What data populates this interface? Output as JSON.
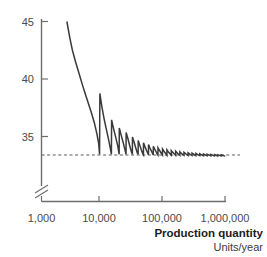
{
  "chart_data": {
    "type": "line",
    "title": "",
    "xlabel": "Production quantity",
    "xlabel_sub": "Units/year",
    "ylabel": "",
    "x_scale": "log",
    "x_tick_labels": [
      "1,000",
      "10,000",
      "100,000",
      "1,000,000"
    ],
    "x_tick_values": [
      1000,
      10000,
      100000,
      1000000
    ],
    "xlim": [
      1000,
      1000000
    ],
    "y_tick_labels": [
      "45",
      "40",
      "35"
    ],
    "y_tick_values": [
      45,
      40,
      35
    ],
    "ylim": [
      33.0,
      45.5
    ],
    "y_axis_break": true,
    "x_axis_break": true,
    "grid": false,
    "legend": "none",
    "asymptote_value": 33.4,
    "asymptote_style": "dashed",
    "series": [
      {
        "name": "unit cost",
        "color": "#3a3a3a",
        "description": "Decaying sawtooth: cost falls with quantity then jumps up at each capacity step, converging on the asymptote.",
        "points": [
          [
            2600,
            45.0
          ],
          [
            2900,
            43.6
          ],
          [
            3200,
            42.5
          ],
          [
            3600,
            41.5
          ],
          [
            4100,
            40.5
          ],
          [
            4600,
            39.6
          ],
          [
            5200,
            38.7
          ],
          [
            5900,
            37.8
          ],
          [
            6600,
            37.0
          ],
          [
            7300,
            36.2
          ],
          [
            8000,
            35.3
          ],
          [
            8600,
            34.4
          ],
          [
            8900,
            33.45
          ],
          [
            9000,
            38.75
          ],
          [
            9700,
            37.6
          ],
          [
            10500,
            36.6
          ],
          [
            11400,
            35.7
          ],
          [
            12300,
            34.9
          ],
          [
            13200,
            34.1
          ],
          [
            13900,
            33.45
          ],
          [
            14000,
            36.45
          ],
          [
            15200,
            35.6
          ],
          [
            16400,
            34.9
          ],
          [
            17600,
            34.2
          ],
          [
            18600,
            33.45
          ],
          [
            18700,
            35.75
          ],
          [
            20100,
            35.1
          ],
          [
            21600,
            34.5
          ],
          [
            23000,
            33.9
          ],
          [
            24100,
            33.45
          ],
          [
            24200,
            35.35
          ],
          [
            25900,
            34.8
          ],
          [
            27700,
            34.2
          ],
          [
            29400,
            33.7
          ],
          [
            30600,
            33.45
          ],
          [
            30700,
            34.95
          ],
          [
            32700,
            34.5
          ],
          [
            34800,
            34.0
          ],
          [
            36700,
            33.6
          ],
          [
            38000,
            33.45
          ],
          [
            38100,
            34.65
          ],
          [
            40400,
            34.25
          ],
          [
            42800,
            33.85
          ],
          [
            45000,
            33.55
          ],
          [
            46400,
            33.42
          ],
          [
            46500,
            34.45
          ],
          [
            49200,
            34.1
          ],
          [
            52000,
            33.8
          ],
          [
            54500,
            33.55
          ],
          [
            56100,
            33.42
          ],
          [
            56200,
            34.3
          ],
          [
            59300,
            34.0
          ],
          [
            62500,
            33.75
          ],
          [
            65400,
            33.52
          ],
          [
            67200,
            33.4
          ],
          [
            67300,
            34.15
          ],
          [
            70900,
            33.9
          ],
          [
            74600,
            33.68
          ],
          [
            78000,
            33.5
          ],
          [
            80100,
            33.4
          ],
          [
            80200,
            34.02
          ],
          [
            84400,
            33.82
          ],
          [
            88700,
            33.63
          ],
          [
            92600,
            33.48
          ],
          [
            95000,
            33.4
          ],
          [
            95100,
            33.92
          ],
          [
            100000,
            33.74
          ],
          [
            105000,
            33.58
          ],
          [
            109500,
            33.46
          ],
          [
            112300,
            33.38
          ],
          [
            112400,
            33.84
          ],
          [
            118000,
            33.68
          ],
          [
            124000,
            33.54
          ],
          [
            129000,
            33.44
          ],
          [
            132300,
            33.38
          ],
          [
            132400,
            33.78
          ],
          [
            139000,
            33.64
          ],
          [
            146000,
            33.52
          ],
          [
            152000,
            33.43
          ],
          [
            155800,
            33.37
          ],
          [
            155900,
            33.72
          ],
          [
            163500,
            33.6
          ],
          [
            171500,
            33.49
          ],
          [
            178500,
            33.41
          ],
          [
            182800,
            33.36
          ],
          [
            182900,
            33.67
          ],
          [
            191500,
            33.56
          ],
          [
            200600,
            33.47
          ],
          [
            208500,
            33.4
          ],
          [
            213400,
            33.36
          ],
          [
            213500,
            33.63
          ],
          [
            223500,
            33.54
          ],
          [
            234000,
            33.45
          ],
          [
            243000,
            33.39
          ],
          [
            248600,
            33.35
          ],
          [
            248700,
            33.59
          ],
          [
            260000,
            33.51
          ],
          [
            272000,
            33.43
          ],
          [
            282500,
            33.38
          ],
          [
            288800,
            33.35
          ],
          [
            288900,
            33.56
          ],
          [
            302000,
            33.49
          ],
          [
            315500,
            33.42
          ],
          [
            327500,
            33.37
          ],
          [
            334700,
            33.34
          ],
          [
            334800,
            33.53
          ],
          [
            349500,
            33.46
          ],
          [
            365000,
            33.4
          ],
          [
            378500,
            33.36
          ],
          [
            386700,
            33.34
          ],
          [
            386800,
            33.5
          ],
          [
            403500,
            33.44
          ],
          [
            421000,
            33.39
          ],
          [
            436300,
            33.35
          ],
          [
            445500,
            33.33
          ],
          [
            445600,
            33.48
          ],
          [
            464500,
            33.42
          ],
          [
            484200,
            33.38
          ],
          [
            501500,
            33.35
          ],
          [
            512000,
            33.33
          ],
          [
            512100,
            33.46
          ],
          [
            533500,
            33.41
          ],
          [
            555700,
            33.37
          ],
          [
            575200,
            33.34
          ],
          [
            587000,
            33.32
          ],
          [
            587100,
            33.44
          ],
          [
            611000,
            33.4
          ],
          [
            636000,
            33.36
          ],
          [
            658000,
            33.33
          ],
          [
            671000,
            33.32
          ],
          [
            671100,
            33.43
          ],
          [
            698000,
            33.39
          ],
          [
            726000,
            33.35
          ],
          [
            750500,
            33.33
          ],
          [
            765000,
            33.31
          ],
          [
            765100,
            33.41
          ],
          [
            795000,
            33.38
          ],
          [
            826500,
            33.35
          ],
          [
            854000,
            33.32
          ],
          [
            870000,
            33.31
          ],
          [
            870100,
            33.4
          ],
          [
            903000,
            33.37
          ],
          [
            937500,
            33.34
          ],
          [
            968000,
            33.32
          ],
          [
            985000,
            33.31
          ],
          [
            1000000,
            33.35
          ]
        ]
      }
    ]
  }
}
